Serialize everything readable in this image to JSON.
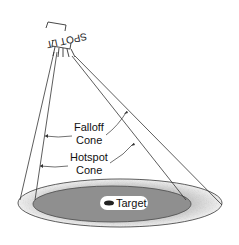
{
  "diagram": {
    "light_label": "SPOTLIGHT",
    "light_label_visible": "SPOT LT",
    "falloff_label_line1": "Falloff",
    "falloff_label_line2": "Cone",
    "hotspot_label_line1": "Hotspot",
    "hotspot_label_line2": "Cone",
    "target_label": "Target",
    "target_icon": "target-marker-icon"
  },
  "colors": {
    "line": "#333333",
    "hotspot_fill": "#8c8c8c",
    "falloff_fill": "#e6e6e6",
    "background": "#ffffff"
  }
}
